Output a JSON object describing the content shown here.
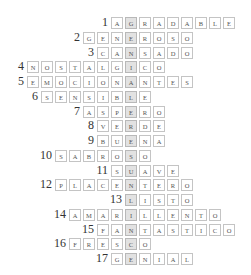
{
  "puzzle": {
    "highlight_color": "#e2e2e2",
    "highlight_column_x": 125,
    "cell_pitch_x": 14,
    "row_top_y": 17,
    "row_pitch_y": 14.75,
    "words": [
      {
        "number": "1",
        "word": "AGRADABLE",
        "highlight_index": 1
      },
      {
        "number": "2",
        "word": "GENEROSO",
        "highlight_index": 3
      },
      {
        "number": "3",
        "word": "CANSADO",
        "highlight_index": 2
      },
      {
        "number": "4",
        "word": "NOSTALGICO",
        "highlight_index": 7
      },
      {
        "number": "5",
        "word": "EMOCIONANTES",
        "highlight_index": 7
      },
      {
        "number": "6",
        "word": "SENSIBLE",
        "highlight_index": 6
      },
      {
        "number": "7",
        "word": "ASPERO",
        "highlight_index": 3
      },
      {
        "number": "8",
        "word": "VERDE",
        "highlight_index": 2
      },
      {
        "number": "9",
        "word": "BUENA",
        "highlight_index": 2
      },
      {
        "number": "10",
        "word": "SABROSO",
        "highlight_index": 5
      },
      {
        "number": "11",
        "word": "SUAVE",
        "highlight_index": 1
      },
      {
        "number": "12",
        "word": "PLACENTERO",
        "highlight_index": 5
      },
      {
        "number": "13",
        "word": "LISTO",
        "highlight_index": 0
      },
      {
        "number": "14",
        "word": "AMARILLENTO",
        "highlight_index": 4
      },
      {
        "number": "15",
        "word": "FANTASTICO",
        "highlight_index": 2
      },
      {
        "number": "16",
        "word": "FRESCO",
        "highlight_index": 4
      },
      {
        "number": "17",
        "word": "GENIAL",
        "highlight_index": 1
      }
    ],
    "hidden_word": "GENIALISIMAMENTE"
  }
}
